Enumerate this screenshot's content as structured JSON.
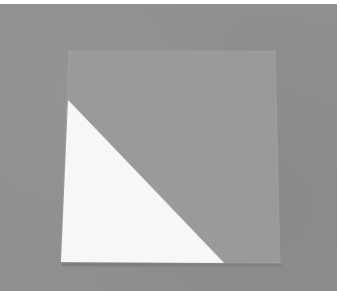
{
  "image": {
    "description": "Photograph of a square sheet of gray paper on a gray background with its lower-left corner folded to reveal a white triangle",
    "colors": {
      "frame": "#ffffff",
      "background": "#8f8f8f",
      "paper_square": "#9a9a9a",
      "folded_triangle": "#f7f7f7",
      "shadow": "#5e5e5e"
    },
    "square": {
      "top_left": [
        69,
        51
      ],
      "top_right": [
        275,
        51
      ],
      "bottom_right": [
        280,
        263
      ],
      "bottom_left": [
        61,
        262
      ]
    },
    "triangle": {
      "top": [
        68,
        100
      ],
      "bottom_left": [
        61,
        262
      ],
      "bottom_right": [
        224,
        263
      ]
    }
  }
}
